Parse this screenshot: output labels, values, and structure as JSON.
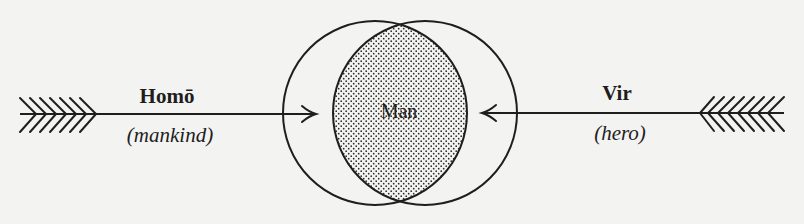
{
  "diagram": {
    "type": "venn-with-converging-arrows",
    "center_label": "Man",
    "left": {
      "term": "Homō",
      "gloss": "(mankind)",
      "arrow_direction": "right"
    },
    "right": {
      "term": "Vir",
      "gloss": "(hero)",
      "arrow_direction": "left"
    },
    "colors": {
      "background": "#f3f3f1",
      "ink": "#1e1e1e",
      "stipple": "#2a2a2a"
    }
  }
}
